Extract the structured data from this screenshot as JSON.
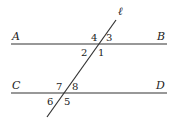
{
  "diagram": {
    "line_ab": {
      "start": "A",
      "end": "B"
    },
    "line_cd": {
      "start": "C",
      "end": "D"
    },
    "transversal": "ℓ",
    "angles_top": [
      "1",
      "2",
      "3",
      "4"
    ],
    "angles_bottom": [
      "5",
      "6",
      "7",
      "8"
    ],
    "color": "#333333"
  }
}
